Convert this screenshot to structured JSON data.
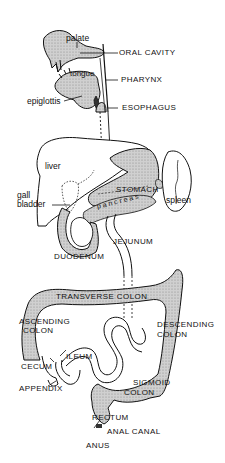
{
  "figure": {
    "colors": {
      "line": "#111111",
      "fill": "#c9c9c9",
      "background": "#ffffff"
    }
  },
  "labels": {
    "palate": "palate",
    "oral_cavity": "ORAL CAVITY",
    "tongue": "tongue",
    "pharynx": "PHARYNX",
    "epiglottis": "epiglottis",
    "esophagus": "ESOPHAGUS",
    "liver": "liver",
    "gall_bladder_1": "gall",
    "gall_bladder_2": "bladder",
    "stomach": "STOMACH",
    "spleen": "spleen",
    "pancreas": "pancreas",
    "jejunum": "JEJUNUM",
    "duodenum": "DUODENUM",
    "transverse_colon": "TRANSVERSE COLON",
    "ascending_colon_1": "ASCENDING",
    "ascending_colon_2": "COLON",
    "descending_colon_1": "DESCENDING",
    "descending_colon_2": "COLON",
    "ileum": "ILEUM",
    "cecum": "CECUM",
    "appendix": "APPENDIX",
    "sigmoid_colon_1": "SIGMOID",
    "sigmoid_colon_2": "COLON",
    "rectum": "RECTUM",
    "anal_canal": "ANAL CANAL",
    "anus": "ANUS"
  }
}
